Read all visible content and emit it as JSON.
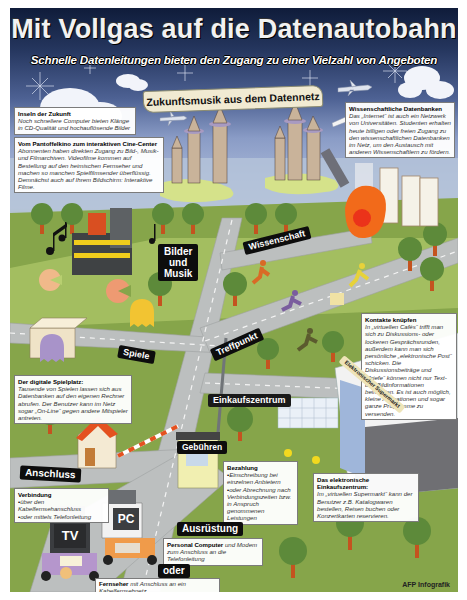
{
  "header": {
    "title": "Mit Vollgas auf die Datenautobahn",
    "subtitle": "Schnelle Datenleitungen bieten den Zugang zu einer Vielzahl von Angeboten",
    "banner": "Zukunftsmusik aus dem Datennetz"
  },
  "info_boxes": {
    "inseln": {
      "heading": "Inseln der Zukunft",
      "text": "Noch schnellere Computer bieten Klänge in CD-Qualität und hochauflösende Bilder"
    },
    "cine_center": {
      "heading": "Vom Pantoffelkino zum interaktiven Cine-Center",
      "text": "Abonnenten haben direkten Zugang zu Bild-, Musik- und Filmarchiven. Videofilme kommen auf Bestellung auf den heimischen Fernseher und machen so manchen Spielfilmsender überflüssig. Demnächst auch auf Ihrem Bildschirm: Interaktive Filme."
    },
    "wissenschaft": {
      "heading": "Wissenschaftliche Datenbanken",
      "text": "Das „Internet“ ist auch ein Netzwerk von Universitäten. Studenten erhalten heute billigen oder freien Zugang zu den wissenschaftlichen Datenbanken im Netz, um den Austausch mit anderen Wissenschaftlern zu fördern."
    },
    "kontakte": {
      "heading": "Kontakte knüpfen",
      "text": "In „virtuellen Cafés“ trifft man sich zu Diskussions- oder lockeren Gesprächsrunden, außerdem kann man sich persönliche „elektronische Post“ schicken. Die Diskussionsbeiträge und „Briefe“ können nicht nur Text- und Bildinformationen beinhalten. Es ist auch möglich, kleine Animationen und sogar ganze Programme zu versenden."
    },
    "spielplatz": {
      "heading": "Der digitale Spielplatz:",
      "text": "Tausende von Spielen lassen sich aus Datenbanken auf den eigenen Rechner abrufen. Der Benutzer kann im Netz sogar „On-Line“ gegen andere Mitspieler antreten."
    },
    "bezahlung": {
      "heading": "Bezahlung",
      "items": [
        "Einschreibung bei einzelnen Anbietern",
        "oder Abrechnung nach Verbindungszeiten bzw. in Anspruch genommenen Leistungen"
      ]
    },
    "einkaufszentrum": {
      "heading": "Das elektronische Einkaufszentrum:",
      "text": "Im „virtuellen Supermarkt“ kann der Benutzer z.B. Katalogwaren bestellen, Reisen buchen oder Konzertkarten reservieren."
    },
    "verbindung": {
      "heading": "Verbindung",
      "items": [
        "über den Kabelfernsehanschluss",
        "oder mittels Telefonleitung"
      ]
    },
    "personal_computer": {
      "heading": "Personal Computer",
      "text": "und Modem zum Anschluss an die Telefonleitung"
    },
    "fernseher": {
      "heading": "Fernseher",
      "text": "mit Anschluss an ein Kabelfernsehnetz"
    }
  },
  "signs": {
    "bilder_musik": [
      "Bilder",
      "und",
      "Musik"
    ],
    "wissenschaft": "Wissenschaft",
    "treffpunkt": "Treffpunkt",
    "spiele": "Spiele",
    "einkaufszentrum": "Einkaufszentrum",
    "gebuehren": "Gebühren",
    "anschluss": "Anschluss",
    "ausruestung": "Ausrüstung",
    "oder": "oder",
    "supermarkt": "Elektronischer Supermarkt"
  },
  "devices": {
    "pc_label": "PC",
    "tv_label": "TV"
  },
  "credit": "AFP Infografik",
  "colors": {
    "sky_top": "#0f1c3a",
    "sky_bottom": "#a9b8d8",
    "grass": "#7f9a3f",
    "road": "#b9bcbc",
    "sign": "#0d0d0d",
    "tree_crown": "#5d8a3a",
    "tree_trunk": "#c4531f"
  }
}
